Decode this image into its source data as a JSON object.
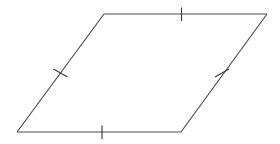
{
  "figure": {
    "name": "Parallelogram",
    "description": "A parallelogram with tick marks indicating two pairs of congruent opposite sides",
    "background_color": "#ffffff",
    "stroke_color": "#4a4a4a",
    "tick_color": "#3d3d3d",
    "stroke_width": 1.15,
    "canvas": {
      "width": 280,
      "height": 144
    }
  },
  "vertices": [
    {
      "id": "A",
      "label": "top-left",
      "x": 104,
      "y": 14
    },
    {
      "id": "B",
      "label": "top-right",
      "x": 267,
      "y": 14
    },
    {
      "id": "C",
      "label": "bottom-right",
      "x": 181,
      "y": 132
    },
    {
      "id": "D",
      "label": "bottom-left",
      "x": 17,
      "y": 132
    }
  ],
  "edges": [
    {
      "id": "top",
      "label": "top side",
      "from": "A",
      "to": "B",
      "x1": 104,
      "y1": 14,
      "x2": 267,
      "y2": 14,
      "tick_count": 1,
      "tick_style": "vertical"
    },
    {
      "id": "right",
      "label": "right side",
      "from": "B",
      "to": "C",
      "x1": 267,
      "y1": 14,
      "x2": 181,
      "y2": 132,
      "tick_count": 1,
      "tick_style": "cross"
    },
    {
      "id": "bottom",
      "label": "bottom side",
      "from": "C",
      "to": "D",
      "x1": 181,
      "y1": 132,
      "x2": 17,
      "y2": 132,
      "tick_count": 1,
      "tick_style": "vertical"
    },
    {
      "id": "left",
      "label": "left side",
      "from": "D",
      "to": "A",
      "x1": 17,
      "y1": 132,
      "x2": 104,
      "y2": 14,
      "tick_count": 1,
      "tick_style": "cross"
    }
  ],
  "tick_marks": [
    {
      "id": "tick-top",
      "edge": "top",
      "center_x": 181.5,
      "center_y": 14,
      "x1": 181.5,
      "y1": 7.5,
      "x2": 181.5,
      "y2": 21,
      "orientation": "vertical"
    },
    {
      "id": "tick-bottom",
      "edge": "bottom",
      "center_x": 102,
      "center_y": 132,
      "x1": 102,
      "y1": 125.5,
      "x2": 102,
      "y2": 139,
      "orientation": "vertical"
    },
    {
      "id": "tick-left",
      "edge": "left",
      "center_x": 60.5,
      "center_y": 73,
      "x1": 53.5,
      "y1": 69,
      "x2": 67.5,
      "y2": 77,
      "orientation": "oblique"
    },
    {
      "id": "tick-right",
      "edge": "right",
      "center_x": 222,
      "center_y": 73,
      "x1": 215,
      "y1": 77,
      "x2": 229,
      "y2": 69,
      "orientation": "oblique"
    }
  ],
  "annotations": {
    "congruent_pair_1": "top and bottom sides each marked with one tick",
    "congruent_pair_2": "left and right sides each marked with one cross tick"
  }
}
